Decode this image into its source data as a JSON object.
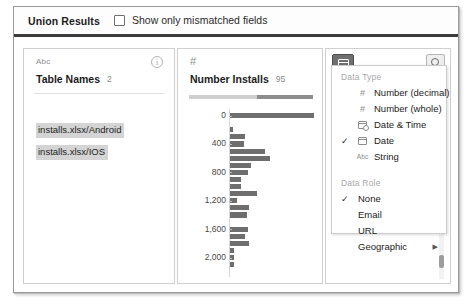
{
  "header": {
    "title": "Union Results",
    "checkbox_label": "Show only mismatched fields",
    "checkbox_checked": false
  },
  "fields": [
    {
      "type_icon": "abc-icon",
      "type_label": "Abc",
      "name": "Table Names",
      "count": "2",
      "info_icon": "info-icon",
      "values": [
        "installs.xlsx/Android",
        "installs.xlsx/IOS"
      ]
    },
    {
      "type_icon": "hash-icon",
      "type_label": "#",
      "name": "Number Installs",
      "count": "95"
    }
  ],
  "chart_data": {
    "type": "bar",
    "orientation": "horizontal",
    "title": "Number Installs",
    "xlabel": "",
    "ylabel": "",
    "ylim": [
      0,
      2200
    ],
    "grid": false,
    "legend": false,
    "categories": [
      0,
      100,
      200,
      300,
      400,
      500,
      600,
      700,
      800,
      900,
      1000,
      1100,
      1200,
      1300,
      1400,
      1500,
      1600,
      1700,
      1800,
      1900,
      2000,
      2100,
      2200
    ],
    "tick_labels": [
      "0",
      "400",
      "800",
      "1,200",
      "1,600",
      "2,000"
    ],
    "values": [
      95,
      0,
      3,
      17,
      16,
      40,
      45,
      24,
      20,
      13,
      12,
      30,
      8,
      22,
      19,
      0,
      20,
      17,
      21,
      5,
      5,
      5,
      0
    ],
    "bar_color": "#6e6e6e"
  },
  "distribution_bar": {
    "left_color": "#cfcfcf",
    "right_color": "#8d8d8d",
    "right_fraction": "45%"
  },
  "toolbar": {
    "date_button_icon": "calendar-icon",
    "search_button_icon": "search-icon",
    "more_menu_icon": "ellipsis-icon",
    "more_menu_label": "..."
  },
  "menu": {
    "section_data_type": {
      "label": "Data Type",
      "items": [
        {
          "label": "Number (decimal)",
          "glyph": "#",
          "glyph_name": "hash-icon",
          "checked": false
        },
        {
          "label": "Number (whole)",
          "glyph": "#",
          "glyph_name": "hash-icon",
          "checked": false
        },
        {
          "label": "Date & Time",
          "glyph": "",
          "glyph_name": "calendar-clock-icon",
          "checked": false
        },
        {
          "label": "Date",
          "glyph": "",
          "glyph_name": "calendar-icon",
          "checked": true
        },
        {
          "label": "String",
          "glyph": "Abc",
          "glyph_name": "abc-icon",
          "checked": false
        }
      ]
    },
    "section_data_role": {
      "label": "Data Role",
      "items": [
        {
          "label": "None",
          "checked": true,
          "submenu": false
        },
        {
          "label": "Email",
          "checked": false,
          "submenu": false
        },
        {
          "label": "URL",
          "checked": false,
          "submenu": false
        },
        {
          "label": "Geographic",
          "checked": false,
          "submenu": true
        }
      ]
    },
    "check_glyph": "✓",
    "submenu_glyph": "▶"
  }
}
